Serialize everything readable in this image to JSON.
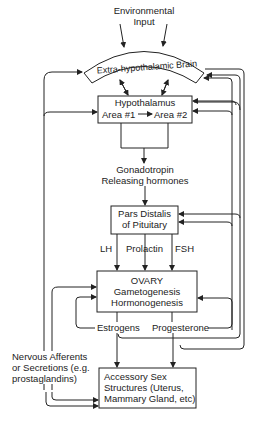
{
  "diagram": {
    "nodes": {
      "environmental_input": {
        "line1": "Environmental",
        "line2": "Input"
      },
      "extra_hypothalamic_brain": {
        "label": "Extra-hypothalamic Brain"
      },
      "hypothalamus": {
        "title": "Hypothalamus",
        "area1": "Area #1",
        "area2": "Area #2"
      },
      "gnrh": {
        "line1": "Gonadotropin",
        "line2": "Releasing hormones"
      },
      "pituitary": {
        "line1": "Pars Distalis",
        "line2": "of Pituitary"
      },
      "ovary": {
        "line1": "OVARY",
        "line2": "Gametogenesis",
        "line3": "Hormonogenesis"
      },
      "estrogens": {
        "label": "Estrogens"
      },
      "progesterone": {
        "label": "Progesterone"
      },
      "nervous_afferents": {
        "line1": "Nervous Afferents",
        "line2": "or Secretions (e.g.",
        "line3": "prostaglandins)"
      },
      "accessory_sex": {
        "line1": "Accessory Sex",
        "line2": "Structures (Uterus,",
        "line3": "Mammary Gland, etc)"
      }
    },
    "edge_labels": {
      "lh": "LH",
      "prolactin": "Prolactin",
      "fsh": "FSH"
    },
    "colors": {
      "line": "#222222",
      "background": "#ffffff"
    }
  }
}
